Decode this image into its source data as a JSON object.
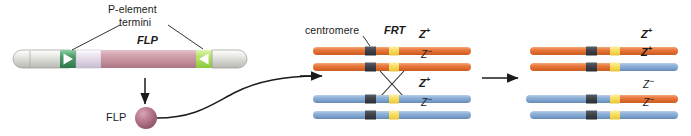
{
  "figure": {
    "type": "biology-schematic"
  },
  "labels": {
    "p_element_line1": "P-element",
    "p_element_line2": "termini",
    "flp_gene": "FLP",
    "flp_protein": "FLP",
    "centromere": "centromere",
    "frt": "FRT",
    "z_plus": "Z",
    "z_plus_sup": "+",
    "z_minus": "Z",
    "z_minus_sup": "−"
  },
  "middle_panel": {
    "chromatids": [
      {
        "name": "chromatid-1",
        "color": "orange",
        "allele": "Z+",
        "allele_style": "bold"
      },
      {
        "name": "chromatid-2",
        "color": "orange",
        "allele": "Z-",
        "allele_style": "italic"
      },
      {
        "name": "chromatid-3",
        "color": "blue",
        "allele": "Z+",
        "allele_style": "bold"
      },
      {
        "name": "chromatid-4",
        "color": "blue",
        "allele": "Z-",
        "allele_style": "italic"
      }
    ]
  },
  "right_panel": {
    "chromatids": [
      {
        "name": "chromatid-1",
        "left_color": "orange",
        "right_color": "orange",
        "allele": "Z+",
        "allele_style": "bold"
      },
      {
        "name": "chromatid-2",
        "left_color": "orange",
        "right_color": "blue",
        "allele": "Z+",
        "allele_style": "bold"
      },
      {
        "name": "chromatid-3",
        "left_color": "blue",
        "right_color": "orange",
        "allele": "Z-",
        "allele_style": "italic"
      },
      {
        "name": "chromatid-4",
        "left_color": "blue",
        "right_color": "blue",
        "allele": "Z-",
        "allele_style": "italic"
      }
    ]
  },
  "colors": {
    "orange": "#E8743B",
    "orange_light": "#F3A06A",
    "blue": "#8FB3DA",
    "blue_dark": "#6D95C4",
    "centromere": "#3E4249",
    "frt_yellow": "#F9DE5C",
    "flp_gene_fill": "#C58E99",
    "flp_protein_fill": "#B06E84",
    "p_terminus_left": "#4C9A6A",
    "p_terminus_right": "#B7E36A",
    "grey_arm": "#D6D6D2",
    "lavender": "#DDD3E4",
    "stroke": "#1b1b1b"
  }
}
